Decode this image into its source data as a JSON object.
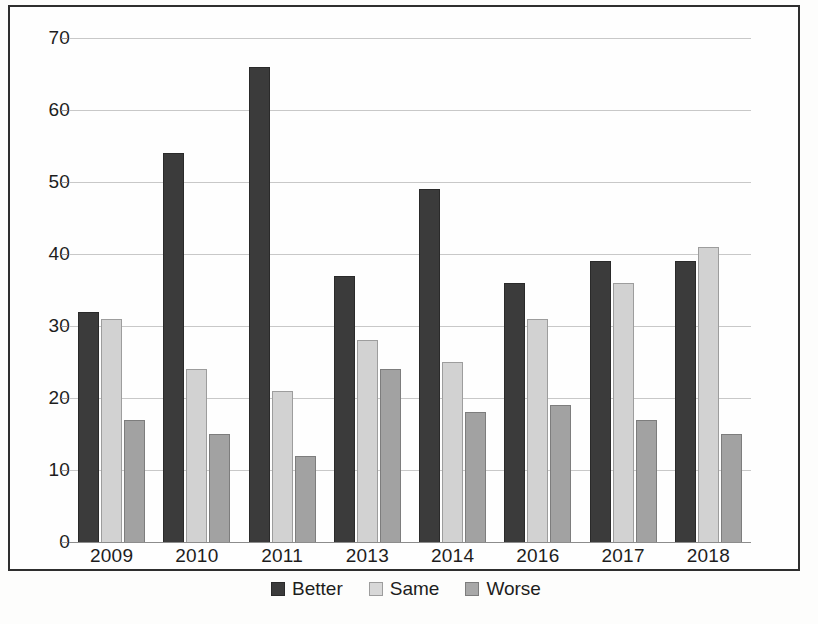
{
  "chart_data": {
    "type": "bar",
    "title": "",
    "subtitle": "",
    "xlabel": "",
    "ylabel": "",
    "categories": [
      "2009",
      "2010",
      "2011",
      "2013",
      "2014",
      "2016",
      "2017",
      "2018"
    ],
    "series": [
      {
        "name": "Better",
        "color": "#3b3b3b",
        "values": [
          32,
          54,
          66,
          37,
          49,
          36,
          39,
          39
        ]
      },
      {
        "name": "Same",
        "color": "#d2d2d2",
        "values": [
          31,
          24,
          21,
          28,
          25,
          31,
          36,
          41
        ]
      },
      {
        "name": "Worse",
        "color": "#a2a2a2",
        "values": [
          17,
          15,
          12,
          24,
          18,
          19,
          17,
          15
        ]
      }
    ],
    "ylim": [
      0,
      70
    ],
    "yticks": [
      0,
      10,
      20,
      30,
      40,
      50,
      60,
      70
    ],
    "ytick_labels": [
      "0",
      "10",
      "20",
      "30",
      "40",
      "50",
      "60",
      "70"
    ],
    "grid": true,
    "grid_axis": "y",
    "legend_position": "bottom",
    "legend_entries": [
      "Better",
      "Same",
      "Worse"
    ],
    "annotations": []
  },
  "frame": {
    "border_color": "#2e2e2e",
    "background": "#fefefe"
  },
  "axis": {
    "grid_color": "#c8c8c8",
    "baseline_color": "#8c8c8c",
    "tick_color": "#9a9a9a",
    "text_color": "#1d1d1d"
  }
}
